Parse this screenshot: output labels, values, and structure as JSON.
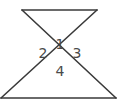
{
  "diagram": {
    "type": "intersecting-lines-vertical-angles",
    "stroke_color": "#3a3a3a",
    "label_color": "#4a4a4a",
    "segments": [
      {
        "name": "top-segment",
        "x1": 22,
        "y1": 10,
        "x2": 97,
        "y2": 10
      },
      {
        "name": "bottom-segment",
        "x1": 1,
        "y1": 98,
        "x2": 116,
        "y2": 98
      },
      {
        "name": "transversal-a",
        "x1": 22,
        "y1": 10,
        "x2": 116,
        "y2": 98
      },
      {
        "name": "transversal-b",
        "x1": 97,
        "y1": 10,
        "x2": 1,
        "y2": 98
      }
    ],
    "intersection": {
      "x": 60,
      "y": 58
    },
    "angle_labels": [
      {
        "text": "1",
        "x": 60,
        "y": 44
      },
      {
        "text": "2",
        "x": 43,
        "y": 53
      },
      {
        "text": "3",
        "x": 77,
        "y": 53
      },
      {
        "text": "4",
        "x": 60,
        "y": 71
      }
    ]
  }
}
